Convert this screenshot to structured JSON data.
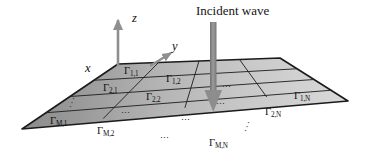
{
  "figure": {
    "type": "3d-surface-mesh-diagram",
    "background_color": "#ffffff"
  },
  "annotations": {
    "incident_wave_label": "Incident wave",
    "incident_arrow": {
      "name": "incident-wave-arrow",
      "color": "#8a8a8a",
      "direction": "downward"
    }
  },
  "axes": {
    "z": {
      "label": "z",
      "color": "#8f8f8f",
      "direction": "up"
    },
    "y": {
      "label": "y",
      "color": "#8f8f8f",
      "direction": "up-right"
    },
    "x": {
      "label": "x",
      "color": "#8f8f8f",
      "direction": "down-left"
    }
  },
  "mesh": {
    "rows": 4,
    "columns": 4,
    "row_indices": [
      "1",
      "2",
      "⋮",
      "M"
    ],
    "column_indices": [
      "1",
      "2",
      "⋯",
      "N"
    ],
    "gamma_symbol": "Γ",
    "edge_color": "#1d1d1d",
    "fill_light": "#d5d5d5",
    "fill_dark": "#8e8e8e",
    "cells": [
      {
        "name": "cell-1-1",
        "symbol": "Γ",
        "sub": "1,1"
      },
      {
        "name": "cell-1-2",
        "symbol": "Γ",
        "sub": "1,2"
      },
      {
        "name": "cell-1-N",
        "symbol": "Γ",
        "sub": "1,N"
      },
      {
        "name": "cell-2-1",
        "symbol": "Γ",
        "sub": "2,1"
      },
      {
        "name": "cell-2-2",
        "symbol": "Γ",
        "sub": "2,2"
      },
      {
        "name": "cell-2-N",
        "symbol": "Γ",
        "sub": "2,N"
      },
      {
        "name": "cell-M-1",
        "symbol": "Γ",
        "sub": "M,1"
      },
      {
        "name": "cell-M-2",
        "symbol": "Γ",
        "sub": "M,2"
      },
      {
        "name": "cell-M-N",
        "symbol": "Γ",
        "sub": "M,N"
      }
    ],
    "ellipses": [
      {
        "name": "ellipsis-diagonal-left",
        "glyph": "⋰"
      },
      {
        "name": "ellipsis-horizontal-row3-col2",
        "glyph": "⋯"
      },
      {
        "name": "ellipsis-horizontal-rowM-col3",
        "glyph": "⋯"
      },
      {
        "name": "ellipsis-horizontal-row1-col3",
        "glyph": "⋯"
      },
      {
        "name": "ellipsis-horizontal-row2-col3",
        "glyph": "⋯"
      },
      {
        "name": "ellipsis-horizontal-row3-col3",
        "glyph": "⋯"
      },
      {
        "name": "ellipsis-diagonal-right",
        "glyph": "⋰"
      }
    ]
  }
}
